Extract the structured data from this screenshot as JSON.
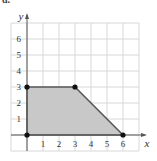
{
  "part_label": "d.",
  "chart_data": {
    "type": "area",
    "title": "",
    "xlabel": "x",
    "ylabel": "y",
    "xlim": [
      0,
      7
    ],
    "ylim": [
      0,
      7
    ],
    "grid": true,
    "x_ticks": [
      1,
      2,
      3,
      4,
      5,
      6
    ],
    "y_ticks": [
      1,
      2,
      3,
      4,
      5,
      6
    ],
    "polygon": [
      [
        0,
        0
      ],
      [
        0,
        3
      ],
      [
        3,
        3
      ],
      [
        6,
        0
      ]
    ],
    "vertices": [
      [
        0,
        0
      ],
      [
        0,
        3
      ],
      [
        3,
        3
      ],
      [
        6,
        0
      ]
    ],
    "fill_color": "#c8c8c8",
    "edge_color": "#555555"
  }
}
